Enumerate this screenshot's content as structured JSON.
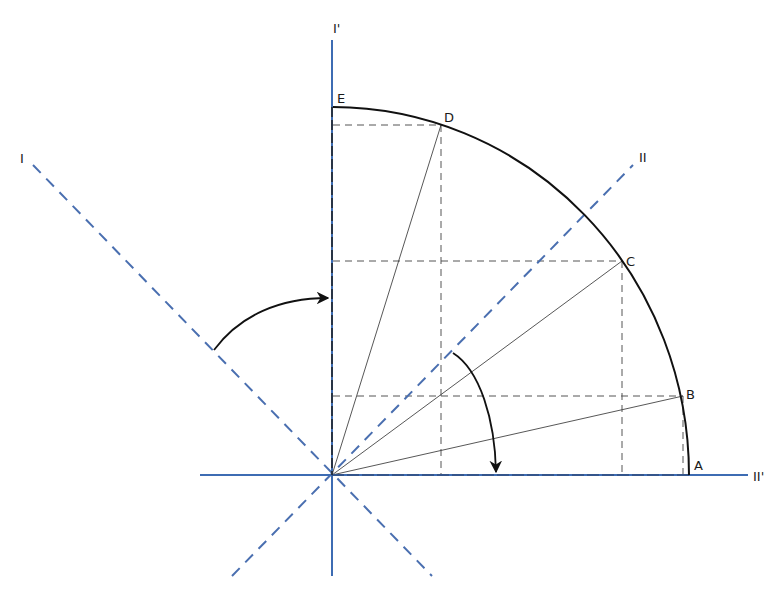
{
  "diagram": {
    "colors": {
      "axis": "#3d6cb3",
      "axis_dashed": "#4a6fb0",
      "curve": "#111111",
      "projection": "#555555"
    },
    "origin": {
      "x": 332,
      "y": 475
    },
    "axes": [
      {
        "id": "I",
        "label": "I",
        "style": "dashed",
        "from": [
          33,
          165
        ],
        "to": [
          432,
          576
        ],
        "label_pos": [
          20,
          163
        ]
      },
      {
        "id": "II",
        "label": "II",
        "style": "dashed",
        "from": [
          232,
          576
        ],
        "to": [
          633,
          165
        ],
        "label_pos": [
          639,
          162
        ]
      },
      {
        "id": "I_prime",
        "label": "I'",
        "style": "solid",
        "from": [
          332,
          40
        ],
        "to": [
          332,
          576
        ],
        "label_pos": [
          333,
          33
        ]
      },
      {
        "id": "II_prime",
        "label": "II'",
        "style": "solid",
        "from": [
          200,
          475
        ],
        "to": [
          748,
          475
        ],
        "label_pos": [
          753,
          481
        ]
      }
    ],
    "points": [
      {
        "label": "A",
        "x": 689,
        "y": 475,
        "label_pos": [
          694,
          470
        ]
      },
      {
        "label": "B",
        "x": 683,
        "y": 396,
        "label_pos": [
          686,
          399
        ]
      },
      {
        "label": "C",
        "x": 622,
        "y": 261,
        "label_pos": [
          626,
          266
        ]
      },
      {
        "label": "D",
        "x": 441,
        "y": 125,
        "label_pos": [
          444,
          122
        ]
      },
      {
        "label": "E",
        "x": 333,
        "y": 107,
        "label_pos": [
          337,
          103
        ]
      }
    ],
    "arrows": [
      {
        "name": "rotation-arrow-I-to-I-prime",
        "description": "curved arrow from axis I to axis I'"
      },
      {
        "name": "rotation-arrow-II-to-II-prime",
        "description": "curved arrow from axis II down to axis II'"
      }
    ]
  }
}
